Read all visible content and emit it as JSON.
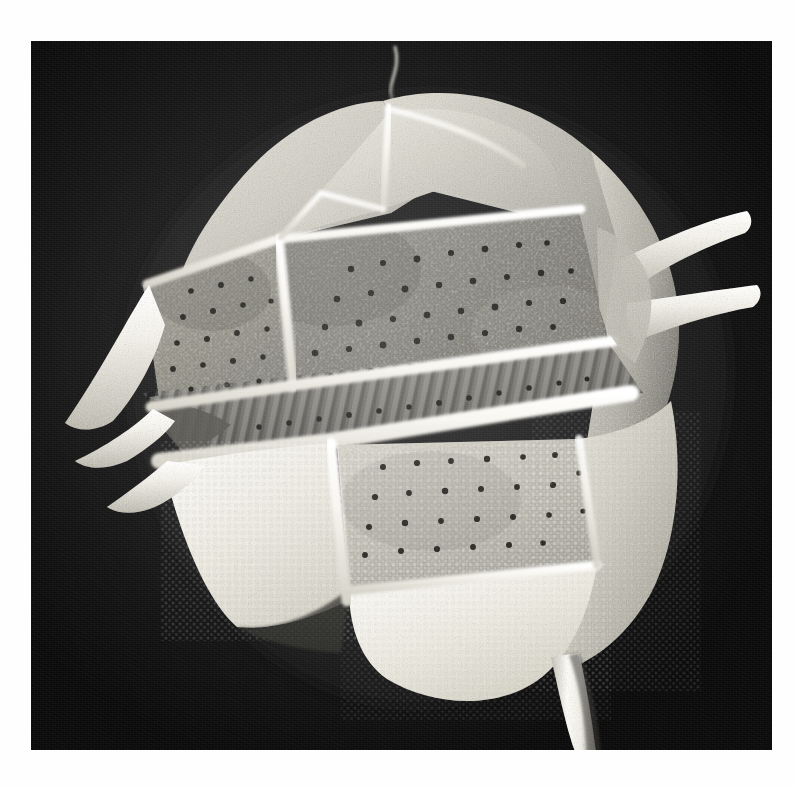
{
  "plate": {
    "kind": "scanning-electron-micrograph",
    "subject": "armored dinoflagellate theca",
    "orientation": "ventral-lateral view",
    "background_color": "#0a0a0a",
    "print_border_color": "#ffffff",
    "caption": "",
    "scale_bar_label": ""
  },
  "photo_area": {
    "left_px": 31,
    "top_px": 41,
    "width_px": 741,
    "height_px": 709
  },
  "palette": {
    "background_black": "#0a0a0a",
    "suture_white": "#f7f6f2",
    "plate_light": "#d9d6cd",
    "plate_mid": "#b3b0a7",
    "plate_dark": "#8a8880",
    "porate_field": "#6f6d66",
    "shadow": "#2c2b28",
    "page_white": "#fefefe"
  },
  "morphology": {
    "apical_filament": {
      "name": "apical-filament",
      "present": true,
      "description": "thin curved thread rising from apex"
    },
    "epitheca": {
      "name": "epitheca",
      "plate_count_visible": 5,
      "surface": "finely granulate / reticulate",
      "description": "upper half above the cingulum, domed"
    },
    "cingulum": {
      "name": "cingulum",
      "description": "transverse girdle groove, ribbed and striated",
      "rib_count_visible": 18,
      "pore_row": true
    },
    "hypotheca": {
      "name": "hypotheca",
      "plate_count_visible": 4,
      "surface": "coarsely areolate with scattered trichocyst pores",
      "description": "lower half below the cingulum, brightly lit"
    },
    "sutures": {
      "name": "thecal-sutures",
      "description": "raised white ridges dividing the plates",
      "count_visible": 9
    },
    "pores": {
      "name": "trichocyst-pores",
      "description": "dark round punctae scattered across plate faces",
      "approx_count_visible": 120
    },
    "lists": {
      "name": "cingular-lists",
      "description": "flared projecting flanges on the left margin",
      "count_visible": 3
    },
    "spines": [
      {
        "name": "antapical-spine",
        "position": "lower-right, pointing down",
        "length_relative": "long",
        "description": "long tapering spine extending below the cell"
      },
      {
        "name": "lateral-spine-upper",
        "position": "right, pointing up-right",
        "length_relative": "medium",
        "description": "upper right projecting horn"
      },
      {
        "name": "lateral-spine-lower",
        "position": "right, pointing right",
        "length_relative": "medium",
        "description": "lower right projecting horn"
      }
    ]
  }
}
